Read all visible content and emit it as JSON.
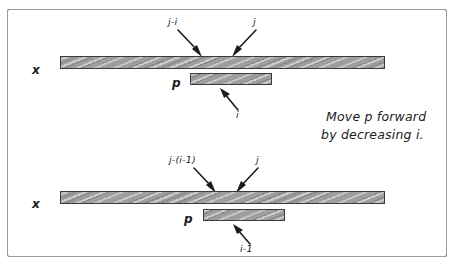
{
  "diagram": {
    "title_note": {
      "line1": "Move p forward",
      "line2": "by decreasing i."
    },
    "groups": [
      {
        "name": "top-state",
        "array_label": "x",
        "pattern_label": "p",
        "annotations": {
          "left_index": "j-i",
          "right_index": "j",
          "offset_index": "i"
        }
      },
      {
        "name": "bottom-state",
        "array_label": "x",
        "pattern_label": "p",
        "annotations": {
          "left_index": "j-(i-1)",
          "right_index": "j",
          "offset_index": "i-1"
        }
      }
    ],
    "colors": {
      "bar_fill": "#9e9e9e",
      "bar_stroke": "#3b3b3b",
      "ink": "#1c1c1c",
      "frame": "#4a4a4a",
      "background": "#ffffff"
    }
  }
}
